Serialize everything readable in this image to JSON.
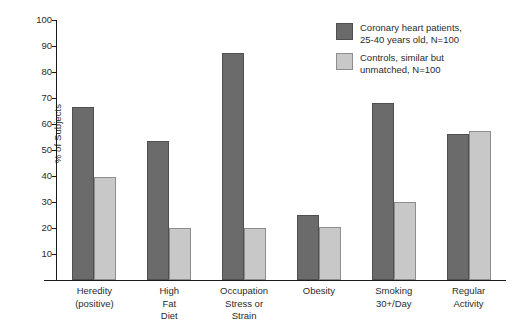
{
  "chart_data": {
    "type": "bar",
    "title": "",
    "xlabel": "",
    "ylabel": "% of Subjects",
    "ylim": [
      0,
      100
    ],
    "yticks": [
      10,
      20,
      30,
      40,
      50,
      60,
      70,
      80,
      90,
      100
    ],
    "grid": false,
    "legend_position": "top-right",
    "categories": [
      "Heredity\n(positive)",
      "High\nFat\nDiet",
      "Occupation\nStress or\nStrain",
      "Obesity",
      "Smoking\n30+/Day",
      "Regular\nActivity"
    ],
    "series": [
      {
        "name": "Coronary heart patients,\n25-40 years old, N=100",
        "color": "#6b6b6b",
        "values": [
          66.5,
          53.5,
          87.5,
          25,
          68,
          56
        ]
      },
      {
        "name": "Controls, similar but\nunmatched, N=100",
        "color": "#c8c8c8",
        "values": [
          39.5,
          20,
          20,
          20.5,
          30,
          57.5
        ]
      }
    ]
  }
}
